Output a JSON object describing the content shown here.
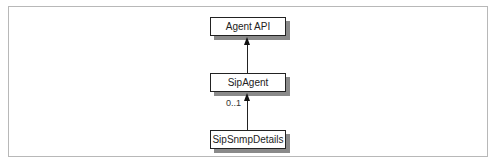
{
  "diagram": {
    "type": "uml-class",
    "nodes": [
      {
        "id": "agent-api",
        "label": "Agent API"
      },
      {
        "id": "sip-agent",
        "label": "SipAgent"
      },
      {
        "id": "sip-snmp-details",
        "label": "SipSnmpDetails"
      }
    ],
    "edges": [
      {
        "from": "sip-agent",
        "to": "agent-api",
        "multiplicity": ""
      },
      {
        "from": "sip-snmp-details",
        "to": "sip-agent",
        "multiplicity": "0..1"
      }
    ]
  }
}
